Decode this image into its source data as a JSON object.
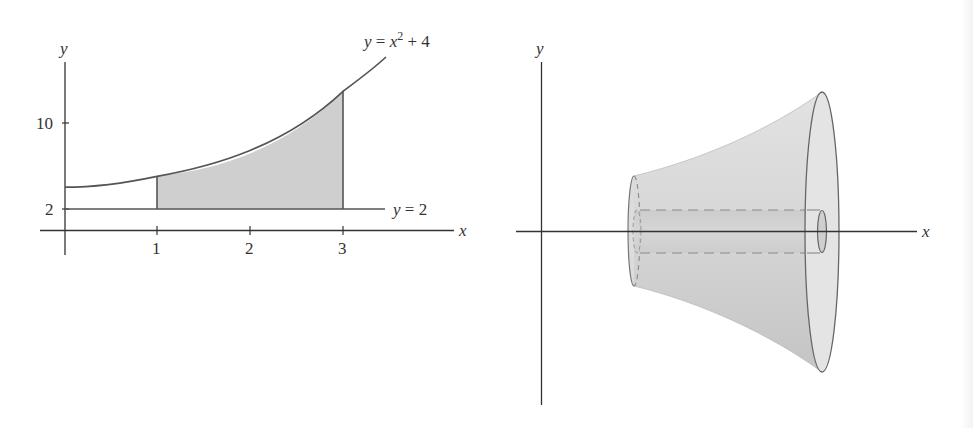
{
  "left_figure": {
    "axes": {
      "x_label": "x",
      "y_label": "y"
    },
    "x_ticks": [
      "1",
      "2",
      "3"
    ],
    "y_ticks": [
      "2",
      "10"
    ],
    "curves": {
      "upper": {
        "label_prefix": "y = x",
        "label_exp": "2",
        "label_suffix": " + 4"
      },
      "lower": {
        "label": "y = 2"
      }
    },
    "shaded_region": {
      "x_from": 1,
      "x_to": 3,
      "fill": "#cfcfcf"
    }
  },
  "right_figure": {
    "axes": {
      "x_label": "x",
      "y_label": "y"
    },
    "solid": {
      "description": "washer-shaped solid of revolution",
      "fill": "#d4d4d4"
    }
  },
  "colors": {
    "stroke": "#555555",
    "axis": "#333333",
    "shade": "#cfcfcf"
  }
}
